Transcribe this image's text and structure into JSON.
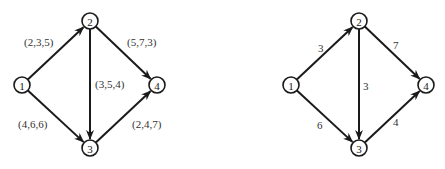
{
  "graphs": [
    {
      "name": "left-network",
      "nodes": [
        {
          "id": "1",
          "x": 22,
          "y": 85
        },
        {
          "id": "2",
          "x": 90,
          "y": 21
        },
        {
          "id": "3",
          "x": 90,
          "y": 148
        },
        {
          "id": "4",
          "x": 157,
          "y": 85
        }
      ],
      "edges": [
        {
          "from": "1",
          "to": "2",
          "label": "(2,3,5)",
          "lx": 24,
          "ly": 46
        },
        {
          "from": "1",
          "to": "3",
          "label": "(4,6,6)",
          "lx": 18,
          "ly": 128
        },
        {
          "from": "2",
          "to": "3",
          "label": "(3,5,4)",
          "lx": 95,
          "ly": 88
        },
        {
          "from": "2",
          "to": "4",
          "label": "(5,7,3)",
          "lx": 127,
          "ly": 46
        },
        {
          "from": "3",
          "to": "4",
          "label": "(2,4,7)",
          "lx": 132,
          "ly": 128
        }
      ]
    },
    {
      "name": "right-network",
      "nodes": [
        {
          "id": "1",
          "x": 291,
          "y": 85
        },
        {
          "id": "2",
          "x": 359,
          "y": 21
        },
        {
          "id": "3",
          "x": 359,
          "y": 148
        },
        {
          "id": "4",
          "x": 426,
          "y": 85
        }
      ],
      "edges": [
        {
          "from": "1",
          "to": "2",
          "label": "3",
          "lx": 318,
          "ly": 52
        },
        {
          "from": "1",
          "to": "3",
          "label": "6",
          "lx": 317,
          "ly": 129
        },
        {
          "from": "2",
          "to": "3",
          "label": "3",
          "lx": 363,
          "ly": 90
        },
        {
          "from": "2",
          "to": "4",
          "label": "7",
          "lx": 393,
          "ly": 49
        },
        {
          "from": "3",
          "to": "4",
          "label": "4",
          "lx": 393,
          "ly": 126
        }
      ]
    }
  ],
  "style": {
    "stroke": "#1a1a1a",
    "node_radius": 8
  }
}
